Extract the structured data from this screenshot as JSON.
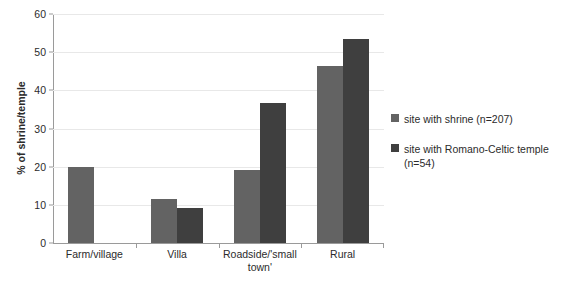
{
  "chart_data": {
    "type": "bar",
    "title": "",
    "xlabel": "",
    "ylabel": "% of shrine/temple",
    "ylim": [
      0,
      60
    ],
    "ytick_step": 10,
    "yticks": [
      0,
      10,
      20,
      30,
      40,
      50,
      60
    ],
    "grid": true,
    "legend_position": "right",
    "categories": [
      "Farm/village",
      "Villa",
      "Roadside/'small town'",
      "Rural"
    ],
    "category_lines": [
      [
        "Farm/village"
      ],
      [
        "Villa"
      ],
      [
        "Roadside/'small",
        "town'"
      ],
      [
        "Rural"
      ]
    ],
    "series": [
      {
        "name": "site with shrine (n=207)",
        "color": "#636363",
        "values": [
          19.9,
          11.5,
          19.2,
          46.3
        ]
      },
      {
        "name": "site with Romano-Celtic temple (n=54)",
        "color": "#3f3f3f",
        "values": [
          0,
          9.2,
          36.8,
          53.5
        ]
      }
    ]
  },
  "legend": {
    "items": [
      {
        "label": "site with shrine (n=207)",
        "color": "#636363"
      },
      {
        "label": "site with Romano-Celtic temple (n=54)",
        "color": "#3f3f3f"
      }
    ]
  },
  "axis": {
    "y_title": "% of shrine/temple"
  },
  "colors": {
    "series_light": "#636363",
    "series_dark": "#3f3f3f",
    "gridline": "#e8e8e8",
    "axis": "#9a9a9a",
    "text": "#2b2b2b",
    "background": "#ffffff"
  }
}
